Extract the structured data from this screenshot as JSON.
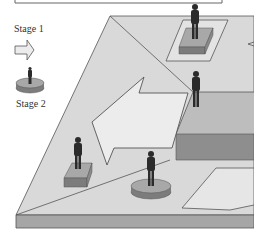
{
  "legend": {
    "stage1_label": "Stage 1",
    "stage2_label": "Stage 2",
    "stage1_icon": "arrow-right-icon",
    "stage2_icon": "round-pedestal-figure-icon"
  },
  "colors": {
    "platform_top": "#d9d9d9",
    "platform_edge": "#a6a6a6",
    "arrow_fill": "#ececec",
    "raised_block_top": "#bdbdbd",
    "raised_block_side": "#8e8e8e",
    "pedestal_top": "#a8a8a8",
    "pedestal_side": "#7c7c7c",
    "figure": "#2b2b2b",
    "outline": "#555555"
  }
}
